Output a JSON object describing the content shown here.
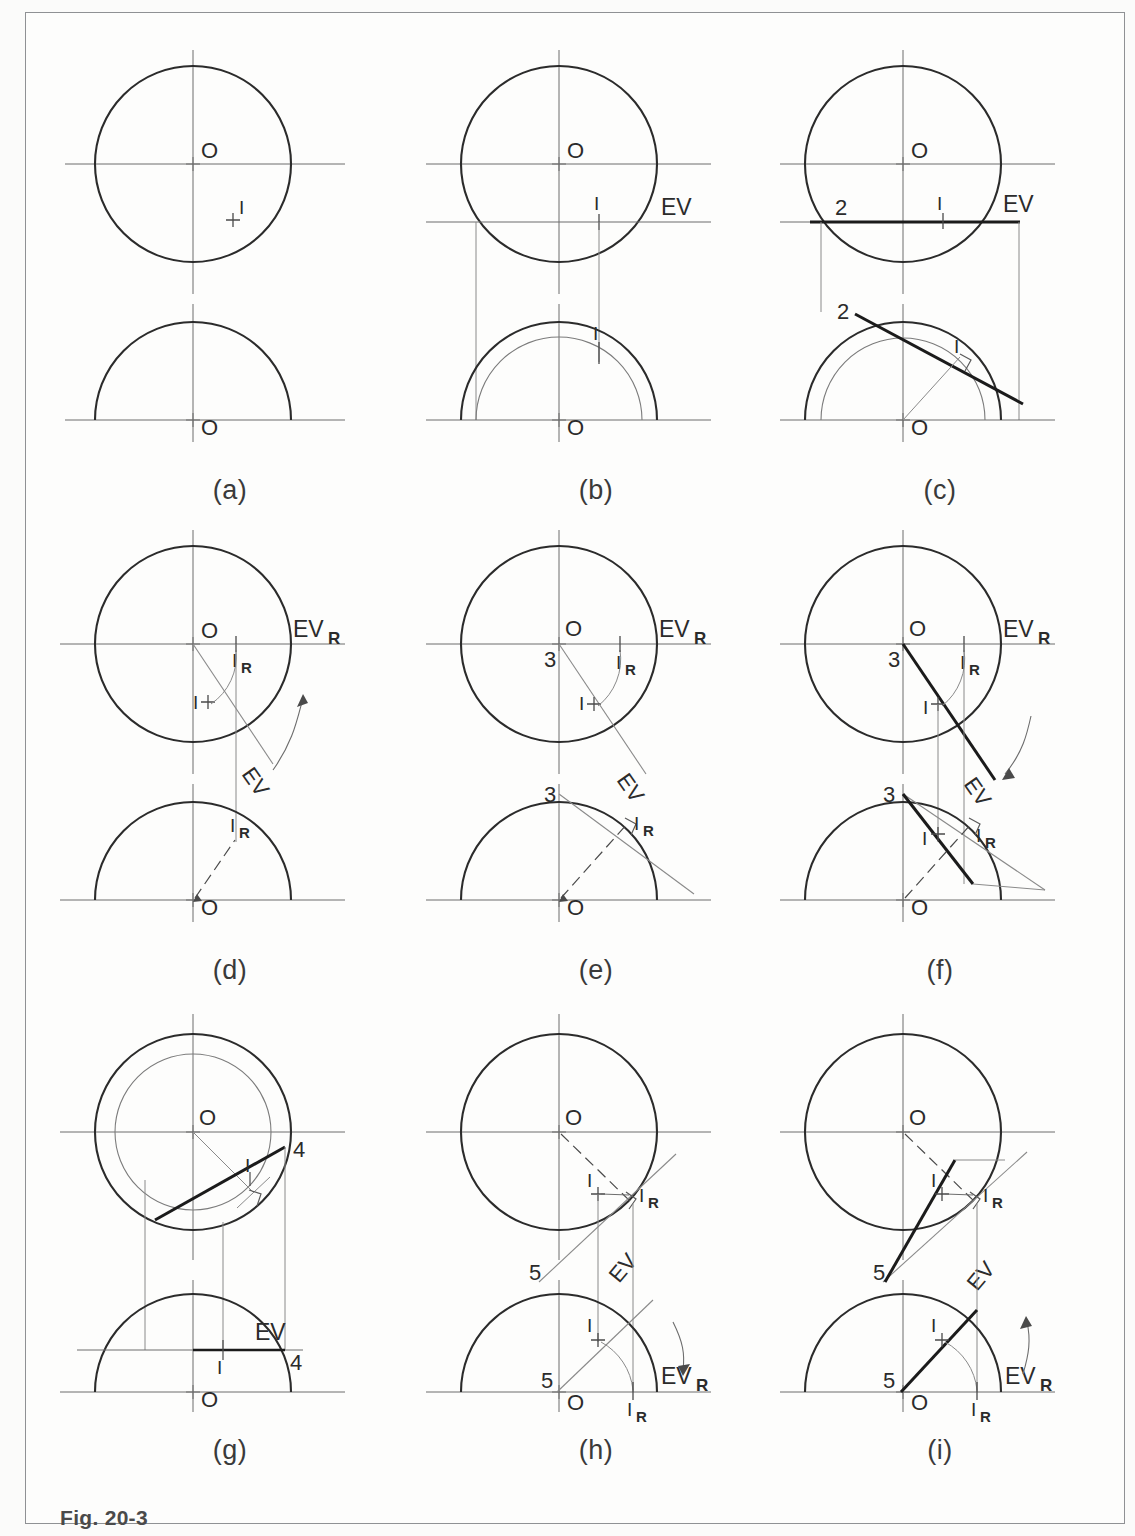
{
  "figure": {
    "caption_label": "Fig. 20-3",
    "caption_text": "Constructions for an oblique plane"
  },
  "panels": [
    {
      "id": "a",
      "caption": "(a)",
      "labels": {
        "center_top": "O",
        "center_front": "O",
        "point": "I"
      }
    },
    {
      "id": "b",
      "caption": "(b)",
      "labels": {
        "center_top": "O",
        "center_front": "O",
        "point": "I",
        "point_front": "I",
        "ev": "EV"
      }
    },
    {
      "id": "c",
      "caption": "(c)",
      "labels": {
        "center_top": "O",
        "center_front": "O",
        "point": "I",
        "point_front": "I",
        "ev": "EV",
        "num_top": "2",
        "num_front": "2"
      }
    },
    {
      "id": "d",
      "caption": "(d)",
      "labels": {
        "center_top": "O",
        "center_front": "O",
        "point": "I",
        "point_rot": "I",
        "point_rot_sub": "R",
        "point_rot_front": "I",
        "point_rot_front_sub": "R",
        "ev": "EV",
        "evr": "EV",
        "evr_sub": "R"
      }
    },
    {
      "id": "e",
      "caption": "(e)",
      "labels": {
        "center_top": "O",
        "center_front": "O",
        "point": "I",
        "point_rot": "I",
        "point_rot_sub": "R",
        "point_rot_front": "I",
        "point_rot_front_sub": "R",
        "ev": "EV",
        "evr": "EV",
        "evr_sub": "R",
        "num_top": "3",
        "num_front": "3"
      }
    },
    {
      "id": "f",
      "caption": "(f)",
      "labels": {
        "center_top": "O",
        "center_front": "O",
        "point": "I",
        "point_front": "I",
        "point_rot": "I",
        "point_rot_sub": "R",
        "point_rot_front": "I",
        "point_rot_front_sub": "R",
        "ev": "EV",
        "evr": "EV",
        "evr_sub": "R",
        "num_top": "3",
        "num_front": "3"
      }
    },
    {
      "id": "g",
      "caption": "(g)",
      "labels": {
        "center_top": "O",
        "center_front": "O",
        "point": "I",
        "point_front": "I",
        "ev": "EV",
        "num_top": "4",
        "num_front": "4"
      }
    },
    {
      "id": "h",
      "caption": "(h)",
      "labels": {
        "center_top": "O",
        "center_front": "O",
        "point": "I",
        "point_front": "I",
        "point_rot": "I",
        "point_rot_sub": "R",
        "point_rot_front": "I",
        "point_rot_front_sub": "R",
        "ev": "EV",
        "evr": "EV",
        "evr_sub": "R",
        "num_top": "5",
        "num_front": "5"
      }
    },
    {
      "id": "i",
      "caption": "(i)",
      "labels": {
        "center_top": "O",
        "center_front": "O",
        "point": "I",
        "point_front": "I",
        "point_rot": "I",
        "point_rot_sub": "R",
        "point_rot_front": "I",
        "point_rot_front_sub": "R",
        "ev": "EV",
        "evr": "EV",
        "evr_sub": "R",
        "num_top": "5",
        "num_front": "5"
      }
    }
  ],
  "colors": {
    "line": "#2b2b2b",
    "thin": "#6d6d6d",
    "paper": "#fdfdfc",
    "border": "#8f9194"
  }
}
